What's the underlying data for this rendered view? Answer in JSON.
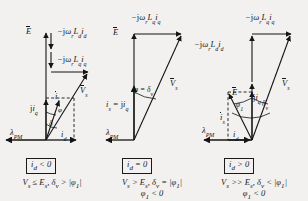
{
  "figure": {
    "type": "phasor-diagram-set",
    "background_color": "#f2f1ef",
    "ink_color": "#151515"
  },
  "panels": [
    {
      "id": "panel-1",
      "condition_box": "i_d < 0",
      "caption_line_1": "V_s ≤ E_s, δ_v > |φ_1|",
      "caption_line_2": "",
      "labels": {
        "emf": "E",
        "drop_d": "−jω_r L_d i_d",
        "drop_q": "−jω_r L_q i_q",
        "vs": "V_s",
        "jiq": "ji_q",
        "is": "i_s",
        "id": "i_d",
        "lambda_pm": "λ_PM",
        "angle_delta": "δ",
        "angle_phi": "φ"
      }
    },
    {
      "id": "panel-2",
      "condition_box": "i_d = 0",
      "caption_line_1": "V_s > E_s, δ_v = |φ_1|",
      "caption_line_2": "φ_1 < 0",
      "labels": {
        "emf": "E",
        "drop_q": "−jω_r L_q i_q",
        "vs": "V_s",
        "is_eq": "i_s = ji_q",
        "lambda_pm": "λ_PM",
        "angle_phi_delta": "φ = δ_v"
      }
    },
    {
      "id": "panel-3",
      "condition_box": "i_d > 0",
      "caption_line_1": "V_s >> E_s, δ_v < |φ_1|",
      "caption_line_2": "φ_1 < 0",
      "labels": {
        "emf": "E",
        "drop_d": "−jω_r L_d i_d",
        "drop_q": "−jω_r L_q i_q",
        "vs": "V_s",
        "jiq": "ji_q",
        "is": "i_s",
        "id": "i_d",
        "lambda_pm": "λ_PM",
        "angle_delta": "δ_v",
        "angle_phi": "φ_1"
      }
    }
  ]
}
